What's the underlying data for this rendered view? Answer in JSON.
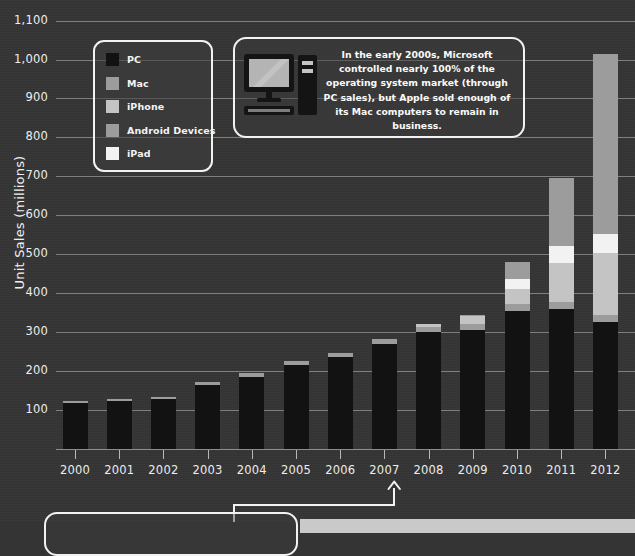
{
  "chart_data": {
    "type": "bar",
    "subtype": "stacked-bar",
    "title": "",
    "xlabel": "",
    "ylabel": "Unit Sales (millions)",
    "ylim": [
      0,
      1100
    ],
    "ytick_step": 100,
    "yticks": [
      "100",
      "200",
      "300",
      "400",
      "500",
      "600",
      "700",
      "800",
      "900",
      "1,000",
      "1,100"
    ],
    "grid": true,
    "legend_position": "inside-top-left",
    "categories": [
      "2000",
      "2001",
      "2002",
      "2003",
      "2004",
      "2005",
      "2006",
      "2007",
      "2008",
      "2009",
      "2010",
      "2011",
      "2012"
    ],
    "series": [
      {
        "name": "PC",
        "color": "#121212",
        "values": [
          118,
          122,
          128,
          165,
          186,
          216,
          237,
          270,
          300,
          305,
          355,
          360,
          325
        ]
      },
      {
        "name": "Mac",
        "color": "#9c9c9c",
        "values": [
          6,
          6,
          6,
          7,
          8,
          10,
          10,
          12,
          14,
          15,
          16,
          17,
          18
        ]
      },
      {
        "name": "iPhone",
        "color": "#c4c4c4",
        "values": [
          0,
          0,
          0,
          0,
          0,
          0,
          0,
          0,
          8,
          22,
          40,
          100,
          160
        ]
      },
      {
        "name": "Android Devices",
        "color": "#9c9c9c",
        "values": [
          0,
          0,
          0,
          0,
          0,
          0,
          0,
          0,
          0,
          2,
          45,
          175,
          460
        ]
      },
      {
        "name": "iPad",
        "color": "#f2f2f2",
        "values": [
          0,
          0,
          0,
          0,
          0,
          0,
          0,
          0,
          0,
          0,
          25,
          45,
          50
        ]
      }
    ],
    "stack_order": [
      "PC",
      "Mac",
      "iPhone",
      "iPad",
      "Android Devices"
    ],
    "totals": [
      124,
      128,
      134,
      172,
      194,
      226,
      247,
      282,
      322,
      344,
      481,
      697,
      1013
    ],
    "annotations": [
      {
        "name": "arrow-2007",
        "target_category": "2007",
        "direction": "up"
      }
    ]
  },
  "legend": {
    "items": [
      {
        "label": "PC",
        "color": "#121212"
      },
      {
        "label": "Mac",
        "color": "#9c9c9c"
      },
      {
        "label": "iPhone",
        "color": "#c4c4c4"
      },
      {
        "label": "Android Devices",
        "color": "#9c9c9c"
      },
      {
        "label": "iPad",
        "color": "#f2f2f2"
      }
    ]
  },
  "callouts": {
    "top": {
      "icon": "desktop-computer-icon",
      "text": "In the early 2000s, Microsoft controlled nearly 100% of the operating system market (through PC sales), but Apple sold enough of its Mac computers to remain in business."
    },
    "bottom": {
      "text": ""
    }
  },
  "theme": {
    "background": "#343434",
    "gridline": "#8c8c8c",
    "text": "#ededed",
    "outline": "#f2f2f2"
  }
}
